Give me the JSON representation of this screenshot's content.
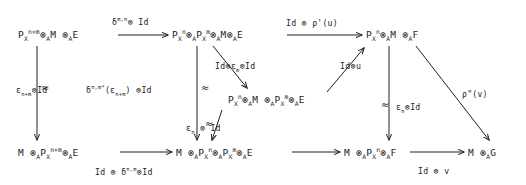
{
  "diagram": {
    "kind": "commutative-diagram",
    "width": 526,
    "height": 185,
    "background": "#ffffff",
    "ink": "#1c1c1c",
    "nodes": [
      {
        "id": "tl",
        "label": "P_X^{n+m} ⊗_A M ⊗_A E",
        "x": 18,
        "y": 36
      },
      {
        "id": "tm",
        "label": "P_X^n ⊗_A P_X^m ⊗_A M ⊗_A E",
        "x": 172,
        "y": 36
      },
      {
        "id": "tr",
        "label": "P_X^n ⊗_A M ⊗_A F",
        "x": 366,
        "y": 36
      },
      {
        "id": "cm",
        "label": "P_X^n ⊗_A M ⊗_A P_X^m ⊗_A E",
        "x": 228,
        "y": 100
      },
      {
        "id": "bl",
        "label": "M ⊗_A P_X^{n+m} ⊗_A E",
        "x": 18,
        "y": 152
      },
      {
        "id": "bm",
        "label": "M ⊗_A P_X^n ⊗_A P_X^m ⊗_A E",
        "x": 176,
        "y": 152
      },
      {
        "id": "br",
        "label": "M ⊗_A P_X^n ⊗_A F",
        "x": 344,
        "y": 152
      },
      {
        "id": "bfr",
        "label": "M ⊗_A G",
        "x": 468,
        "y": 152
      }
    ],
    "edge_labels": {
      "top_left_arrow": "δ^{m,n} ⊗ Id",
      "top_right_arrow": "Id ⊗ ρ'(u)",
      "left_vertical": "ε_{n+m} ⊗ Id",
      "middle_vertical": "δ^{n,m*}(ε_{n+m}) ⊗ Id",
      "diag_down": "Id ⊗ ε_m ⊗ Id",
      "diag_up": "Id ⊗ u",
      "center_down": "ε_n ⊗ Id",
      "right_vertical": "ε_n ⊗ Id",
      "far_right_diag": "ρ\"(v)",
      "bottom_left_arrow": "Id ⊗ δ^{n,m} ⊗ Id",
      "bottom_right_arrow": "Id ⊗ v"
    },
    "iso_marks": [
      "≈",
      "≈",
      "≈",
      "≈"
    ]
  }
}
